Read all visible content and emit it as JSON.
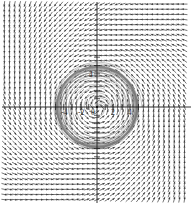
{
  "figure": {
    "kind": "phase-portrait",
    "title": "",
    "background_color": "#ffffff"
  },
  "chart_data": {
    "type": "scatter",
    "title": "",
    "subtitle": "",
    "xlabel": "",
    "ylabel": "",
    "xlim": [
      -5.8,
      5.8
    ],
    "ylim": [
      -6.2,
      6.2
    ],
    "grid": false,
    "legend": null,
    "legend_position": "none",
    "origin_px": {
      "x": 97,
      "y": 107
    },
    "units_per_px": 0.1205,
    "px_per_unit": 8.3,
    "axes": {
      "x_axis_visible": true,
      "y_axis_visible": true,
      "axis_color": "#1a1a1a",
      "x_ticks": [
        -5,
        -4,
        -3,
        -2,
        -1,
        1,
        2,
        3,
        4,
        5
      ],
      "y_ticks": [
        -6,
        -5,
        -4,
        -3,
        -2,
        -1,
        1,
        2,
        3,
        4,
        5,
        6
      ],
      "tick_length_px": 3,
      "x_tick_labels": [
        {
          "value": -4,
          "text": "-4"
        },
        {
          "value": -2,
          "text": "-2"
        },
        {
          "value": 0,
          "text": "0"
        },
        {
          "value": 2,
          "text": "2"
        },
        {
          "value": 4,
          "text": "4"
        }
      ],
      "y_tick_labels": [
        {
          "value": 4,
          "text": "4"
        }
      ]
    },
    "limit_cycles": [
      {
        "name": "inner-limit-cycle",
        "radius": 2.0,
        "stability": "unstable",
        "color": "#000000"
      },
      {
        "name": "outer-limit-cycle",
        "radius": 4.85,
        "stability": "stable",
        "color": "#000000"
      }
    ],
    "spiral_trajectories": {
      "count": 18,
      "direction": "counterclockwise",
      "color": "#7a7a7a",
      "description": "inward and outward spiralling orbits between and around the limit cycles"
    },
    "vector_field": {
      "direction": "counterclockwise",
      "grid_spacing_units": 0.62,
      "arrow_color": "#4a4a4a",
      "head_color": "#3a3a3a",
      "description": "rotational vector field with radial component toward the stable limit cycle"
    }
  }
}
